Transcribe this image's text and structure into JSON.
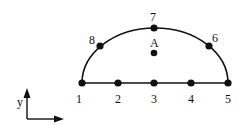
{
  "diagram": {
    "type": "finite-element-node-layout",
    "colors": {
      "stroke": "#111111",
      "node": "#111111",
      "background": "#ffffff"
    },
    "nodes": [
      {
        "id": "1",
        "label": "1",
        "x": 82,
        "y": 83,
        "label_x": 76,
        "label_y": 103
      },
      {
        "id": "2",
        "label": "2",
        "x": 118,
        "y": 83,
        "label_x": 115,
        "label_y": 103
      },
      {
        "id": "3",
        "label": "3",
        "x": 154,
        "y": 83,
        "label_x": 151,
        "label_y": 103
      },
      {
        "id": "4",
        "label": "4",
        "x": 191,
        "y": 83,
        "label_x": 188,
        "label_y": 103
      },
      {
        "id": "5",
        "label": "5",
        "x": 228,
        "y": 83,
        "label_x": 225,
        "label_y": 103
      },
      {
        "id": "6",
        "label": "6",
        "x": 209,
        "y": 46,
        "label_x": 212,
        "label_y": 42
      },
      {
        "id": "7",
        "label": "7",
        "x": 154,
        "y": 28,
        "label_x": 150,
        "label_y": 21
      },
      {
        "id": "8",
        "label": "8",
        "x": 100,
        "y": 46,
        "label_x": 89,
        "label_y": 44
      }
    ],
    "interior_point": {
      "label": "A",
      "x": 154,
      "y": 53,
      "label_x": 150,
      "label_y": 47
    },
    "edges": {
      "base": {
        "from": "1",
        "to": "5"
      },
      "arc": {
        "from": "1",
        "through": "7",
        "to": "5",
        "rx": 73,
        "ry": 55
      }
    },
    "axes": {
      "origin": {
        "x": 27,
        "y": 119
      },
      "y_label": "y",
      "x_label": "x"
    }
  }
}
